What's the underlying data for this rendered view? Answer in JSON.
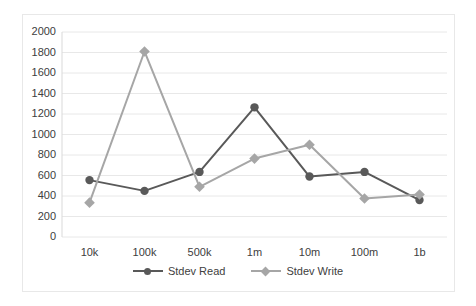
{
  "chart_data": {
    "type": "line",
    "title": "",
    "subtitle": "",
    "xlabel": "",
    "ylabel": "",
    "categories": [
      "10k",
      "100k",
      "500k",
      "1m",
      "10m",
      "100m",
      "1b"
    ],
    "series": [
      {
        "name": "Stdev Read",
        "color": "#595959",
        "marker": "circle",
        "values": [
          555,
          450,
          635,
          1265,
          590,
          635,
          360
        ]
      },
      {
        "name": "Stdev Write",
        "color": "#a6a6a6",
        "marker": "diamond",
        "values": [
          335,
          1810,
          490,
          765,
          900,
          375,
          415
        ]
      }
    ],
    "ylim": [
      0,
      2000
    ],
    "y_ticks": [
      0,
      200,
      400,
      600,
      800,
      1000,
      1200,
      1400,
      1600,
      1800,
      2000
    ],
    "y_tick_labels": [
      "0",
      "200",
      "400",
      "600",
      "800",
      "1000",
      "1200",
      "1400",
      "1600",
      "1800",
      "2000"
    ],
    "grid": true,
    "grid_axis": "y",
    "grid_color": "#e8e8e8",
    "legend_position": "bottom",
    "plot_background": "#ffffff",
    "border_color": "#e8e8e8"
  },
  "legend": {
    "entries": [
      {
        "label": "Stdev Read"
      },
      {
        "label": "Stdev Write"
      }
    ]
  }
}
